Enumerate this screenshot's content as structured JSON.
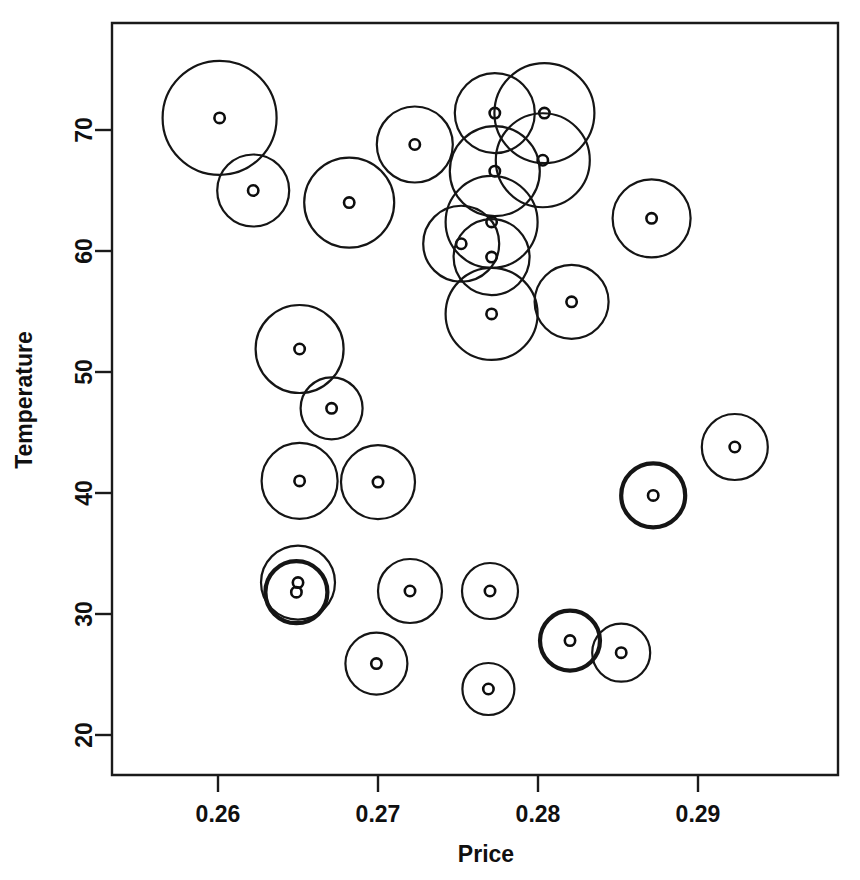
{
  "chart_data": {
    "type": "scatter",
    "title": "",
    "subtitle": "",
    "xlabel": "Price",
    "ylabel": "Temperature",
    "xlim": [
      0.2535,
      0.2989
    ],
    "ylim": [
      16.7,
      78.3
    ],
    "xticks": [
      0.26,
      0.27,
      0.28,
      0.29
    ],
    "xtick_labels": [
      "0.26",
      "0.27",
      "0.28",
      "0.29"
    ],
    "yticks": [
      20,
      30,
      40,
      50,
      60,
      70
    ],
    "ytick_labels": [
      "20",
      "30",
      "40",
      "50",
      "60",
      "70"
    ],
    "grid": false,
    "legend": null,
    "marker": "open-circle-with-small-center-circle",
    "size_encoding": "bubble radius encodes a third variable",
    "points": [
      {
        "x": 0.2601,
        "y": 71.0,
        "r_px": 57,
        "bold": false
      },
      {
        "x": 0.2622,
        "y": 65.0,
        "r_px": 36,
        "bold": false
      },
      {
        "x": 0.2682,
        "y": 64.0,
        "r_px": 45,
        "bold": false
      },
      {
        "x": 0.2723,
        "y": 68.8,
        "r_px": 38,
        "bold": false
      },
      {
        "x": 0.2773,
        "y": 71.4,
        "r_px": 40,
        "bold": false
      },
      {
        "x": 0.2804,
        "y": 71.4,
        "r_px": 50,
        "bold": false
      },
      {
        "x": 0.2803,
        "y": 67.5,
        "r_px": 47,
        "bold": false
      },
      {
        "x": 0.2773,
        "y": 66.6,
        "r_px": 45,
        "bold": false
      },
      {
        "x": 0.2771,
        "y": 62.4,
        "r_px": 46,
        "bold": false
      },
      {
        "x": 0.2752,
        "y": 60.6,
        "r_px": 38,
        "bold": false
      },
      {
        "x": 0.2771,
        "y": 59.5,
        "r_px": 38,
        "bold": false
      },
      {
        "x": 0.2771,
        "y": 54.8,
        "r_px": 46,
        "bold": false
      },
      {
        "x": 0.2821,
        "y": 55.8,
        "r_px": 37,
        "bold": false
      },
      {
        "x": 0.2871,
        "y": 62.7,
        "r_px": 39,
        "bold": false
      },
      {
        "x": 0.2651,
        "y": 51.9,
        "r_px": 44,
        "bold": false
      },
      {
        "x": 0.2671,
        "y": 47.0,
        "r_px": 31,
        "bold": false
      },
      {
        "x": 0.2651,
        "y": 41.0,
        "r_px": 38,
        "bold": false
      },
      {
        "x": 0.27,
        "y": 40.9,
        "r_px": 37,
        "bold": false
      },
      {
        "x": 0.2923,
        "y": 43.8,
        "r_px": 33,
        "bold": false
      },
      {
        "x": 0.2872,
        "y": 39.8,
        "r_px": 32,
        "bold": true
      },
      {
        "x": 0.265,
        "y": 32.6,
        "r_px": 37,
        "bold": false
      },
      {
        "x": 0.2649,
        "y": 31.8,
        "r_px": 31,
        "bold": true
      },
      {
        "x": 0.272,
        "y": 31.9,
        "r_px": 32,
        "bold": false
      },
      {
        "x": 0.277,
        "y": 31.9,
        "r_px": 28,
        "bold": false
      },
      {
        "x": 0.2699,
        "y": 25.9,
        "r_px": 31,
        "bold": false
      },
      {
        "x": 0.2769,
        "y": 23.8,
        "r_px": 26,
        "bold": false
      },
      {
        "x": 0.282,
        "y": 27.8,
        "r_px": 30,
        "bold": true
      },
      {
        "x": 0.2852,
        "y": 26.8,
        "r_px": 29,
        "bold": false
      }
    ]
  }
}
